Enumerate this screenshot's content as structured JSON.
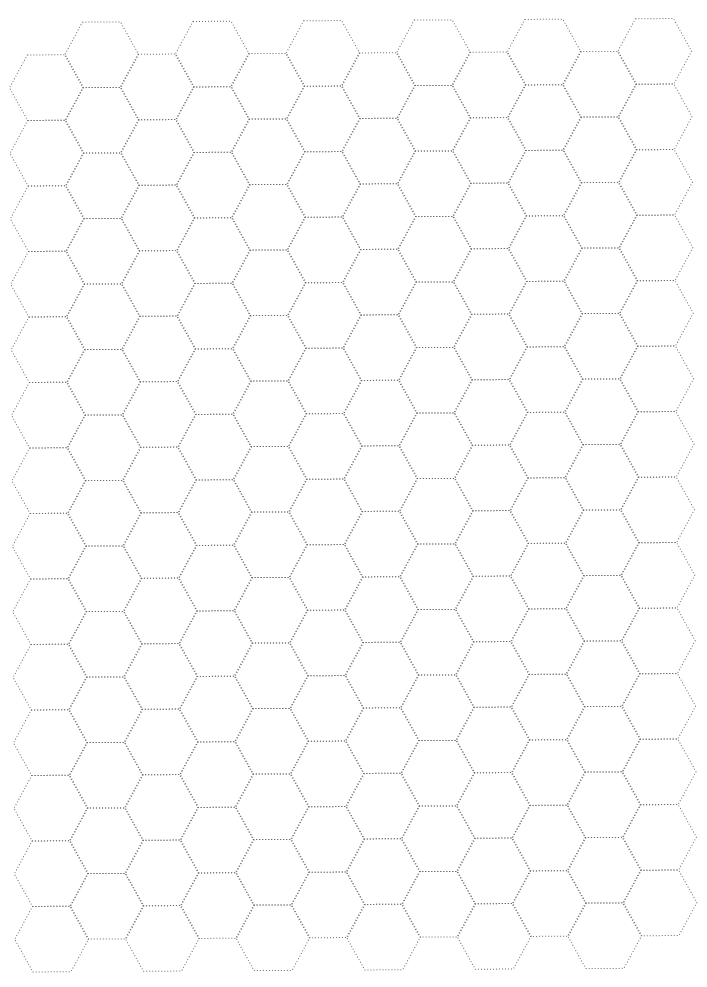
{
  "page": {
    "type": "hexagonal-grid-paper",
    "background": "#ffffff",
    "line_color": "#6a6a6a",
    "line_style": "dotted"
  },
  "grid": {
    "orientation": "flat-top",
    "columns": 12,
    "hexes_per_column": 14,
    "origin_x": 12,
    "even_column_top_y": 53,
    "odd_column_top_y": 20.5,
    "column_spacing": 55.3,
    "hex_width": 74,
    "hex_top_edge_width": 38,
    "hex_height": 65.5,
    "rotation_deg": 0.35
  }
}
